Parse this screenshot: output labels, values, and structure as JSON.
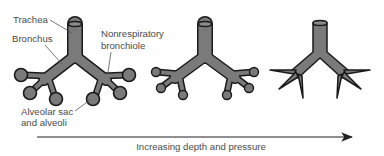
{
  "diagram": {
    "labels": {
      "trachea": "Trachea",
      "bronchus": "Bronchus",
      "nonrespiratory_line1": "Nonrespiratory",
      "nonrespiratory_line2": "bronchiole",
      "alveolar_line1": "Alveolar sac",
      "alveolar_line2": "and alveoli"
    },
    "stages": [
      {
        "name": "uncompressed",
        "alveoli": "inflated"
      },
      {
        "name": "partially-compressed",
        "alveoli": "smaller"
      },
      {
        "name": "collapsed",
        "alveoli": "collapsed"
      }
    ],
    "arrow": {
      "caption": "Increasing depth and pressure"
    },
    "colors": {
      "airway_fill": "#7a7a7a",
      "airway_outline": "#1a1a1a",
      "text": "#4a4a4a",
      "leader_line": "#555555"
    }
  }
}
